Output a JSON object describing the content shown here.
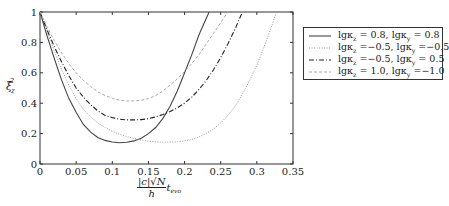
{
  "chart_data": {
    "type": "line",
    "title": "",
    "xlabel": "|c|√N / h · t_evo",
    "ylabel": "ξ_z^2",
    "xlim": [
      0,
      0.35
    ],
    "ylim": [
      0,
      1
    ],
    "grid": false,
    "legend_position": "outside right, top",
    "x_ticks": [
      "0",
      "0.05",
      "0.1",
      "0.15",
      "0.2",
      "0.25",
      "0.3",
      "0.35"
    ],
    "y_ticks": [
      "0",
      "0.2",
      "0.4",
      "0.6",
      "0.8",
      "1"
    ],
    "series": [
      {
        "name": "lgκz = 0.8, lgκy = 0.8",
        "style": "solid",
        "color": "#444444",
        "x": [
          0,
          0.01,
          0.02,
          0.03,
          0.04,
          0.05,
          0.06,
          0.07,
          0.08,
          0.09,
          0.1,
          0.11,
          0.12,
          0.13,
          0.14,
          0.15,
          0.16,
          0.17,
          0.18,
          0.19,
          0.2,
          0.21,
          0.22,
          0.234
        ],
        "y": [
          1.0,
          0.84,
          0.69,
          0.55,
          0.43,
          0.34,
          0.26,
          0.21,
          0.175,
          0.155,
          0.145,
          0.14,
          0.143,
          0.152,
          0.17,
          0.2,
          0.24,
          0.3,
          0.38,
          0.48,
          0.6,
          0.72,
          0.85,
          1.0
        ]
      },
      {
        "name": "lgκz = −0.5, lgκy = −0.5",
        "style": "dotted",
        "color": "#999999",
        "x": [
          0,
          0.01,
          0.02,
          0.03,
          0.04,
          0.05,
          0.06,
          0.07,
          0.08,
          0.09,
          0.1,
          0.11,
          0.12,
          0.13,
          0.14,
          0.15,
          0.16,
          0.17,
          0.18,
          0.19,
          0.2,
          0.21,
          0.22,
          0.23,
          0.24,
          0.25,
          0.26,
          0.27,
          0.28,
          0.29,
          0.3,
          0.31,
          0.32,
          0.327
        ],
        "y": [
          1.0,
          0.87,
          0.74,
          0.62,
          0.52,
          0.43,
          0.36,
          0.31,
          0.27,
          0.24,
          0.215,
          0.195,
          0.18,
          0.168,
          0.158,
          0.15,
          0.146,
          0.144,
          0.144,
          0.146,
          0.152,
          0.162,
          0.178,
          0.2,
          0.23,
          0.27,
          0.32,
          0.38,
          0.46,
          0.55,
          0.65,
          0.77,
          0.9,
          1.0
        ]
      },
      {
        "name": "lgκz = −0.5, lgκy = 0.5",
        "style": "dashdot",
        "color": "#222222",
        "x": [
          0,
          0.01,
          0.02,
          0.03,
          0.04,
          0.05,
          0.06,
          0.07,
          0.08,
          0.09,
          0.1,
          0.11,
          0.12,
          0.13,
          0.14,
          0.15,
          0.16,
          0.17,
          0.18,
          0.19,
          0.2,
          0.21,
          0.22,
          0.23,
          0.24,
          0.25,
          0.26,
          0.27,
          0.28
        ],
        "y": [
          1.0,
          0.88,
          0.77,
          0.67,
          0.58,
          0.5,
          0.44,
          0.39,
          0.35,
          0.32,
          0.305,
          0.295,
          0.29,
          0.29,
          0.292,
          0.298,
          0.31,
          0.325,
          0.345,
          0.37,
          0.4,
          0.44,
          0.49,
          0.55,
          0.62,
          0.7,
          0.79,
          0.89,
          1.0
        ]
      },
      {
        "name": "lgκz = 1.0, lgκy = −1.0",
        "style": "dashed",
        "color": "#aaaaaa",
        "x": [
          0,
          0.01,
          0.02,
          0.03,
          0.04,
          0.05,
          0.06,
          0.07,
          0.08,
          0.09,
          0.1,
          0.11,
          0.12,
          0.13,
          0.14,
          0.15,
          0.16,
          0.17,
          0.18,
          0.19,
          0.2,
          0.21,
          0.22,
          0.23,
          0.24,
          0.25,
          0.26
        ],
        "y": [
          1.0,
          0.9,
          0.81,
          0.73,
          0.66,
          0.6,
          0.55,
          0.51,
          0.475,
          0.45,
          0.432,
          0.42,
          0.415,
          0.415,
          0.42,
          0.43,
          0.45,
          0.48,
          0.52,
          0.56,
          0.61,
          0.66,
          0.72,
          0.79,
          0.86,
          0.93,
          1.0
        ]
      }
    ]
  },
  "legend": {
    "items": [
      {
        "prefix_a": "lgκ",
        "sub_a": "z",
        "mid": " = 0.8, lgκ",
        "sub_b": "y",
        "suffix": " = 0.8"
      },
      {
        "prefix_a": "lgκ",
        "sub_a": "z",
        "mid": " =−0.5, lgκ",
        "sub_b": "y",
        "suffix": " =−0.5"
      },
      {
        "prefix_a": "lgκ",
        "sub_a": "z",
        "mid": " =−0.5, lgκ",
        "sub_b": "y",
        "suffix": " = 0.5"
      },
      {
        "prefix_a": "lgκ",
        "sub_a": "z",
        "mid": " = 1.0, lgκ",
        "sub_b": "y",
        "suffix": " =−1.0"
      }
    ]
  },
  "axis_labels": {
    "x_num": "|c|√N",
    "x_den": "h",
    "x_suffix": "t",
    "x_suffix_sub": "evo",
    "y_main": "ξ",
    "y_sub": "z",
    "y_sup": "2"
  }
}
